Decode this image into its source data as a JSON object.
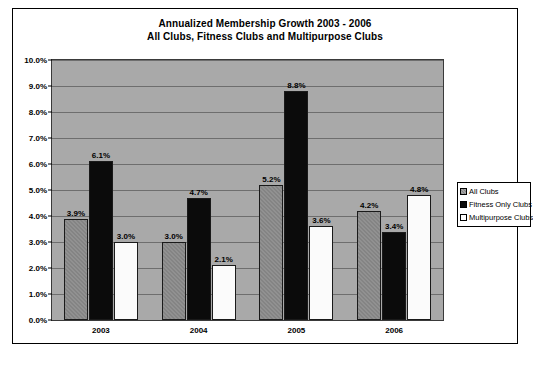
{
  "chart_data": {
    "type": "bar",
    "title": "Annualized Membership Growth 2003 - 2006",
    "subtitle": "All Clubs, Fitness Clubs and Multipurpose Clubs",
    "xlabel": "",
    "ylabel": "",
    "categories": [
      "2003",
      "2004",
      "2005",
      "2006"
    ],
    "series": [
      {
        "name": "All Clubs",
        "values": [
          3.9,
          3.0,
          5.2,
          4.2
        ],
        "color": "#848484"
      },
      {
        "name": "Fitness Only Clubs",
        "values": [
          6.1,
          4.7,
          8.8,
          3.4
        ],
        "color": "#0b0b0b"
      },
      {
        "name": "Multipurpose Clubs",
        "values": [
          3.0,
          2.1,
          3.6,
          4.8
        ],
        "color": "#ffffff"
      }
    ],
    "data_labels": [
      [
        "3.9%",
        "3.0%",
        "5.2%",
        "4.2%"
      ],
      [
        "6.1%",
        "4.7%",
        "8.8%",
        "3.4%"
      ],
      [
        "3.0%",
        "2.1%",
        "3.6%",
        "4.8%"
      ]
    ],
    "ylim": [
      0,
      10
    ],
    "ytick_step": 1,
    "ytick_labels": [
      "10.0%",
      "9.0%",
      "8.0%",
      "7.0%",
      "6.0%",
      "5.0%",
      "4.0%",
      "3.0%",
      "2.0%",
      "1.0%",
      "0.0%"
    ],
    "grid": true,
    "legend_position": "right",
    "plot_background": "#a9a9a9"
  },
  "footer": {
    "text": ""
  }
}
